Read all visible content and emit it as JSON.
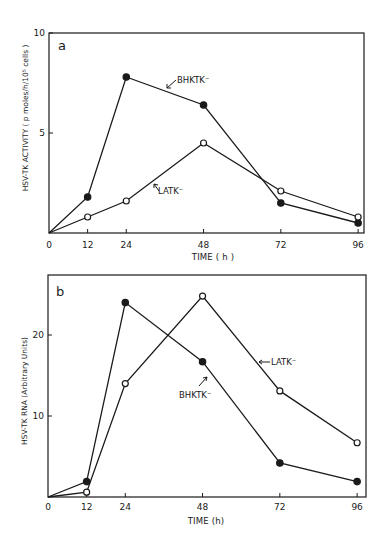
{
  "chart_data": [
    {
      "type": "line",
      "panel": "a",
      "title": "",
      "xlabel": "TIME ( h )",
      "ylabel": "HSV-TK ACTIVITY ( p moles/h/10⁵ cells )",
      "x": [
        0,
        12,
        24,
        48,
        72,
        96
      ],
      "x_ticks": [
        "0",
        "12",
        "24",
        "48",
        "72",
        "96"
      ],
      "y_ticks": [
        "5",
        "10"
      ],
      "ylim": [
        0,
        10
      ],
      "xlim": [
        0,
        96
      ],
      "grid": false,
      "series": [
        {
          "name": "BHKTK⁻",
          "marker": "filled-circle",
          "values": [
            0,
            1.8,
            7.8,
            6.4,
            1.5,
            0.5
          ]
        },
        {
          "name": "LATK⁻",
          "marker": "open-circle",
          "values": [
            0,
            0.8,
            1.6,
            4.5,
            2.1,
            0.8
          ]
        }
      ],
      "annotations": [
        "BHKTK⁻",
        "LATK⁻"
      ]
    },
    {
      "type": "line",
      "panel": "b",
      "title": "",
      "xlabel": "TIME (h)",
      "ylabel": "HSV-TK RNA (Arbitrary Units)",
      "x": [
        0,
        12,
        24,
        48,
        72,
        96
      ],
      "x_ticks": [
        "0",
        "12",
        "24",
        "48",
        "72",
        "96"
      ],
      "y_ticks": [
        "10",
        "20"
      ],
      "ylim": [
        0,
        27.4
      ],
      "xlim": [
        0,
        96
      ],
      "grid": false,
      "series": [
        {
          "name": "BHKTK⁻",
          "marker": "filled-circle",
          "values": [
            0,
            1.9,
            24,
            16.7,
            4.2,
            1.9
          ]
        },
        {
          "name": "LATK⁻",
          "marker": "open-circle",
          "values": [
            0,
            0.6,
            14,
            24.8,
            13.1,
            6.7
          ]
        }
      ],
      "annotations": [
        "LATK⁻",
        "BHKTK⁻"
      ]
    }
  ],
  "panels": {
    "a": {
      "letter": "a",
      "xlabel": "TIME ( h )",
      "ylabel": "HSV-TK ACTIVITY ( p moles/h/10⁵ cells )",
      "label_bhk": "BHKTK⁻",
      "label_latk": "LATK⁻"
    },
    "b": {
      "letter": "b",
      "xlabel": "TIME (h)",
      "ylabel": "HSV-TK RNA (Arbitrary Units)",
      "label_bhk": "BHKTK⁻",
      "label_latk": "LATK⁻"
    }
  }
}
